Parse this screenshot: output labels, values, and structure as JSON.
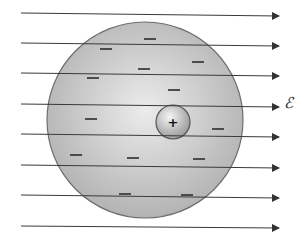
{
  "diagram": {
    "field_label": "ℰ",
    "colors": {
      "line": "#3a3a3a",
      "cloud_edge": "#6e6e6e",
      "cloud_light": "#e6e6e6",
      "cloud_dark": "#b5b5b5",
      "nucleus_light": "#f0f0f0",
      "nucleus_dark": "#9a9a9a",
      "minus": "#3f3f3f"
    },
    "electron_cloud": {
      "cx": 145,
      "cy": 120,
      "r": 98
    },
    "nucleus": {
      "cx": 173,
      "cy": 122,
      "r": 17,
      "symbol": "+"
    },
    "field_lines": [
      {
        "x1": 21,
        "y1": 13,
        "x2": 279,
        "y2": 16
      },
      {
        "x1": 21,
        "y1": 43,
        "x2": 279,
        "y2": 46
      },
      {
        "x1": 21,
        "y1": 73,
        "x2": 279,
        "y2": 76
      },
      {
        "x1": 21,
        "y1": 104,
        "x2": 279,
        "y2": 107
      },
      {
        "x1": 21,
        "y1": 134,
        "x2": 279,
        "y2": 137
      },
      {
        "x1": 21,
        "y1": 165,
        "x2": 279,
        "y2": 168
      },
      {
        "x1": 21,
        "y1": 195,
        "x2": 279,
        "y2": 198
      },
      {
        "x1": 21,
        "y1": 226,
        "x2": 279,
        "y2": 228
      }
    ],
    "negative_charges": [
      {
        "x": 150,
        "y": 39
      },
      {
        "x": 106,
        "y": 49
      },
      {
        "x": 198,
        "y": 62
      },
      {
        "x": 144,
        "y": 69
      },
      {
        "x": 93,
        "y": 78
      },
      {
        "x": 174,
        "y": 90
      },
      {
        "x": 91,
        "y": 119
      },
      {
        "x": 218,
        "y": 129
      },
      {
        "x": 76,
        "y": 155
      },
      {
        "x": 133,
        "y": 158
      },
      {
        "x": 199,
        "y": 159
      },
      {
        "x": 125,
        "y": 194
      },
      {
        "x": 187,
        "y": 195
      }
    ]
  }
}
